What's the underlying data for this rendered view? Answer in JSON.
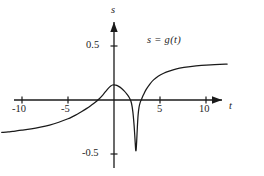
{
  "chart_data": {
    "type": "line",
    "title": "",
    "annotation": "s = g(t)",
    "xlabel": "t",
    "ylabel": "s",
    "xlim": [
      -12.5,
      13.5
    ],
    "ylim": [
      -0.62,
      0.62
    ],
    "grid": false,
    "legend": "none",
    "xticks": [
      -10,
      -5,
      5,
      10
    ],
    "xtick_labels": [
      "-10",
      "-5",
      "5",
      "10"
    ],
    "yticks": [
      0.5,
      -0.5
    ],
    "ytick_labels": [
      "0.5",
      "-0.5"
    ],
    "axis_arrows": [
      "x-positive",
      "y-positive"
    ],
    "series": [
      {
        "name": "g(t)",
        "color": "#1a1a1a",
        "points": [
          [
            -12.2,
            -0.3
          ],
          [
            -11.5,
            -0.295
          ],
          [
            -11.0,
            -0.29
          ],
          [
            -10.0,
            -0.28
          ],
          [
            -9.0,
            -0.268
          ],
          [
            -8.0,
            -0.252
          ],
          [
            -7.0,
            -0.232
          ],
          [
            -6.0,
            -0.206
          ],
          [
            -5.0,
            -0.174
          ],
          [
            -4.5,
            -0.154
          ],
          [
            -4.0,
            -0.132
          ],
          [
            -3.5,
            -0.107
          ],
          [
            -3.0,
            -0.08
          ],
          [
            -2.5,
            -0.05
          ],
          [
            -2.0,
            -0.018
          ],
          [
            -1.6,
            0.012
          ],
          [
            -1.2,
            0.048
          ],
          [
            -0.9,
            0.08
          ],
          [
            -0.6,
            0.11
          ],
          [
            -0.35,
            0.13
          ],
          [
            -0.15,
            0.139
          ],
          [
            0.0,
            0.14
          ],
          [
            0.2,
            0.137
          ],
          [
            0.5,
            0.126
          ],
          [
            0.8,
            0.108
          ],
          [
            1.1,
            0.084
          ],
          [
            1.4,
            0.054
          ],
          [
            1.7,
            0.016
          ],
          [
            1.9,
            -0.03
          ],
          [
            2.05,
            -0.11
          ],
          [
            2.18,
            -0.23
          ],
          [
            2.28,
            -0.36
          ],
          [
            2.35,
            -0.455
          ],
          [
            2.4,
            -0.465
          ],
          [
            2.46,
            -0.39
          ],
          [
            2.54,
            -0.25
          ],
          [
            2.62,
            -0.14
          ],
          [
            2.72,
            -0.068
          ],
          [
            2.85,
            -0.022
          ],
          [
            3.0,
            0.008
          ],
          [
            3.2,
            0.048
          ],
          [
            3.5,
            0.098
          ],
          [
            3.9,
            0.148
          ],
          [
            4.3,
            0.186
          ],
          [
            4.8,
            0.22
          ],
          [
            5.4,
            0.248
          ],
          [
            6.0,
            0.268
          ],
          [
            6.8,
            0.288
          ],
          [
            7.6,
            0.301
          ],
          [
            8.5,
            0.312
          ],
          [
            9.5,
            0.32
          ],
          [
            10.5,
            0.326
          ],
          [
            11.5,
            0.33
          ],
          [
            12.3,
            0.332
          ]
        ]
      }
    ]
  },
  "labels": {
    "x_axis_name": "t",
    "y_axis_name": "s",
    "equation": "s = g(t)",
    "x_tick_neg10": "-10",
    "x_tick_neg5": "-5",
    "x_tick_pos5": "5",
    "x_tick_pos10": "10",
    "y_tick_pos": "0.5",
    "y_tick_neg": "-0.5"
  }
}
